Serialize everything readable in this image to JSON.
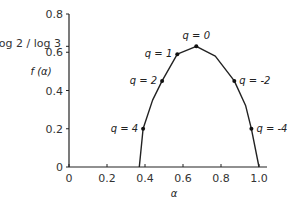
{
  "chart_data": {
    "type": "line",
    "title": "",
    "xlabel": "α",
    "ylabel": "f (α)",
    "xlim": [
      0,
      1.0
    ],
    "ylim": [
      0,
      0.8
    ],
    "xticks": [
      "0",
      "0.2",
      "0.4",
      "0.6",
      "0.8",
      "1.0"
    ],
    "yticks": [
      "0",
      "0.2",
      "0.4",
      "0.6",
      "0.8"
    ],
    "special_ytick": {
      "label": "log 2 / log 3",
      "value": 0.631
    },
    "grid": false,
    "series": [
      {
        "name": "f(α) spectrum",
        "x": [
          0.37,
          0.39,
          0.44,
          0.49,
          0.57,
          0.67,
          0.77,
          0.87,
          0.93,
          0.96,
          1.0
        ],
        "y": [
          0.0,
          0.2,
          0.35,
          0.45,
          0.59,
          0.631,
          0.58,
          0.45,
          0.32,
          0.2,
          0.0
        ]
      }
    ],
    "annotations": [
      {
        "label": "q = 4",
        "x": 0.39,
        "y": 0.2
      },
      {
        "label": "q = 2",
        "x": 0.49,
        "y": 0.45
      },
      {
        "label": "q = 1",
        "x": 0.57,
        "y": 0.59
      },
      {
        "label": "q = 0",
        "x": 0.67,
        "y": 0.631
      },
      {
        "label": "q = -2",
        "x": 0.87,
        "y": 0.45
      },
      {
        "label": "q = -4",
        "x": 0.96,
        "y": 0.2
      }
    ]
  }
}
